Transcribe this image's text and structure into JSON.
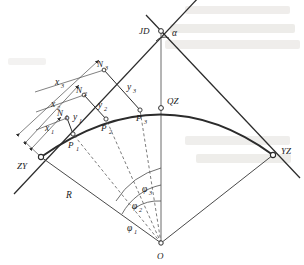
{
  "figure": {
    "domain": "engineering-survey-diagram",
    "canvas": {
      "width": 304,
      "height": 265,
      "background": "#ffffff"
    },
    "stroke_color": "#2b2b2b",
    "dash_color": "#5a5a5a",
    "label_color": "#1a1a1a",
    "bleed_color": "#d8d6d2"
  },
  "points": {
    "jd": {
      "label": "JD",
      "x": 161,
      "y": 31
    },
    "zy": {
      "label": "ZY",
      "x": 41,
      "y": 157
    },
    "yz": {
      "label": "YZ",
      "x": 273,
      "y": 155
    },
    "qz": {
      "label": "QZ",
      "x": 161,
      "y": 108
    },
    "o": {
      "label": "O",
      "x": 161,
      "y": 243
    },
    "p1": {
      "label": "P",
      "sub": "1",
      "x": 73,
      "y": 134
    },
    "p2": {
      "label": "P",
      "sub": "2",
      "x": 106,
      "y": 119
    },
    "p3": {
      "label": "P",
      "sub": "3",
      "x": 140,
      "y": 110
    },
    "n1": {
      "label": "N",
      "sub": "1",
      "x": 67,
      "y": 118
    },
    "n2": {
      "label": "N",
      "sub": "2",
      "x": 84,
      "y": 95
    },
    "n3": {
      "label": "N",
      "sub": "3",
      "x": 104,
      "y": 70
    }
  },
  "labels": {
    "alpha": "α",
    "radius": "R",
    "jd": "JD",
    "zy": "ZY",
    "yz": "YZ",
    "qz": "QZ",
    "o": "O"
  },
  "offsets_x": [
    {
      "name": "x",
      "sub": "1",
      "label": "x",
      "x": 50,
      "y": 128
    },
    {
      "name": "x",
      "sub": "2",
      "label": "x",
      "x": 56,
      "y": 104
    },
    {
      "name": "x",
      "sub": "3",
      "label": "x",
      "x": 60,
      "y": 82
    }
  ],
  "offsets_y": [
    {
      "name": "y",
      "sub": "1",
      "label": "y",
      "x": 77,
      "y": 117
    },
    {
      "name": "y",
      "sub": "2",
      "label": "y",
      "x": 102,
      "y": 105
    },
    {
      "name": "y",
      "sub": "3",
      "label": "y",
      "x": 131,
      "y": 87
    }
  ],
  "angles": [
    {
      "name": "phi",
      "sub": "1",
      "label": "φ",
      "x": 131,
      "y": 228
    },
    {
      "name": "phi",
      "sub": "2",
      "label": "φ",
      "x": 136,
      "y": 206
    },
    {
      "name": "phi",
      "sub": "3",
      "label": "φ",
      "x": 146,
      "y": 189
    }
  ],
  "bleed_through_text": {
    "visible": true,
    "description": "faint ghost text showing through from reverse page",
    "lines": [
      {
        "x": 190,
        "y": 14,
        "text": ""
      },
      {
        "x": 175,
        "y": 32,
        "text": ""
      },
      {
        "x": 170,
        "y": 48,
        "text": ""
      },
      {
        "x": 195,
        "y": 145,
        "text": ""
      },
      {
        "x": 205,
        "y": 162,
        "text": ""
      }
    ]
  }
}
